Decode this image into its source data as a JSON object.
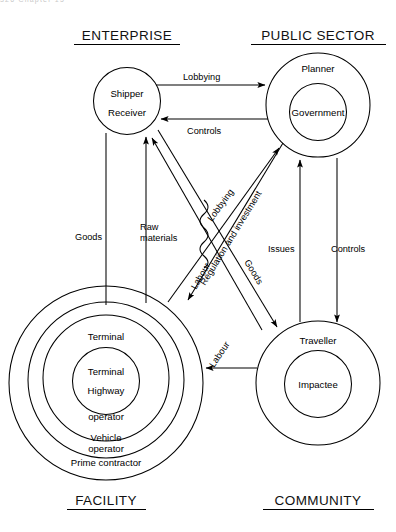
{
  "page": {
    "running_head": "326   Chapter 15",
    "background_color": "#ffffff",
    "ink_color": "#000000"
  },
  "quadrant_titles": {
    "top_left": "ENTERPRISE",
    "top_right": "PUBLIC SECTOR",
    "bottom_left": "FACILITY",
    "bottom_right": "COMMUNITY"
  },
  "nodes": {
    "enterprise": {
      "title": "ENTERPRISE",
      "rings": [
        {
          "label_lines": [
            "Shipper",
            "Receiver"
          ]
        }
      ]
    },
    "public_sector": {
      "title": "PUBLIC SECTOR",
      "rings": [
        {
          "label_lines": [
            "Planner"
          ]
        },
        {
          "label_lines": [
            "Government"
          ]
        }
      ]
    },
    "facility": {
      "title": "FACILITY",
      "rings": [
        {
          "label_lines": [
            "Prime contractor"
          ]
        },
        {
          "label_lines": [
            "Vehicle",
            "operator"
          ]
        },
        {
          "label_lines": [
            "Terminal",
            "operator"
          ]
        },
        {
          "label_lines": [
            "Terminal",
            "Highway"
          ]
        }
      ]
    },
    "community": {
      "title": "COMMUNITY",
      "rings": [
        {
          "label_lines": [
            "Traveller"
          ]
        },
        {
          "label_lines": [
            "Impactee"
          ]
        }
      ]
    }
  },
  "edges": [
    {
      "id": "lobbying-top",
      "label": "Lobbying",
      "from": "enterprise",
      "to": "public_sector",
      "direction": "right"
    },
    {
      "id": "controls-top",
      "label": "Controls",
      "from": "public_sector",
      "to": "enterprise",
      "direction": "left"
    },
    {
      "id": "goods-left",
      "label": "Goods",
      "from": "facility",
      "to": "enterprise",
      "direction": "up"
    },
    {
      "id": "raw-materials",
      "label": "Raw\nmaterials",
      "from": "facility",
      "to": "enterprise",
      "direction": "up"
    },
    {
      "id": "lobbying-diagonal",
      "label": "Lobbying",
      "from": "facility",
      "to": "public_sector",
      "direction": "up-right"
    },
    {
      "id": "regulation",
      "label": "Regulation and investment",
      "from": "public_sector",
      "to": "facility",
      "direction": "down-left"
    },
    {
      "id": "goods-diagonal",
      "label": "Goods",
      "from": "enterprise",
      "to": "community",
      "direction": "down-right"
    },
    {
      "id": "labour-diagonal",
      "label": "Labour",
      "from": "community",
      "to": "enterprise",
      "direction": "up-left"
    },
    {
      "id": "issues",
      "label": "Issues",
      "from": "community",
      "to": "public_sector",
      "direction": "up"
    },
    {
      "id": "controls-right",
      "label": "Controls",
      "from": "public_sector",
      "to": "community",
      "direction": "down"
    },
    {
      "id": "labour-horizontal",
      "label": "Labour",
      "from": "community",
      "to": "facility",
      "direction": "left"
    }
  ],
  "edge_labels": {
    "lobbying_top": "Lobbying",
    "controls_top": "Controls",
    "goods_left": "Goods",
    "raw_materials_line1": "Raw",
    "raw_materials_line2": "materials",
    "lobbying_diagonal": "Lobbying",
    "regulation": "Regulation and investment",
    "goods_diagonal": "Goods",
    "labour_diagonal": "Labour",
    "issues": "Issues",
    "controls_right": "Controls",
    "labour_horizontal": "Labour"
  },
  "node_labels": {
    "shipper": "Shipper",
    "receiver": "Receiver",
    "planner": "Planner",
    "government": "Government",
    "terminal_inner": "Terminal",
    "highway_inner": "Highway",
    "terminal_ring": "Terminal",
    "operator_ring": "operator",
    "vehicle": "Vehicle",
    "vehicle_operator": "operator",
    "prime_contractor": "Prime contractor",
    "traveller": "Traveller",
    "impactee": "Impactee"
  }
}
